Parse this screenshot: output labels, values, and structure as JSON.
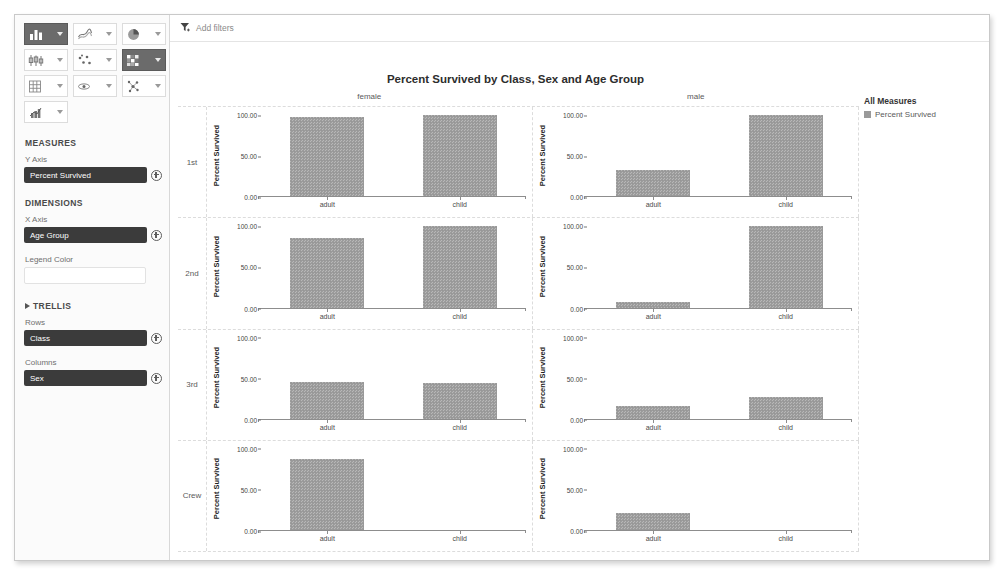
{
  "toolbar": {
    "buttons": [
      {
        "icon": "bar-chart-icon",
        "selected": true
      },
      {
        "icon": "line-chart-icon",
        "selected": false
      },
      {
        "icon": "pie-chart-icon",
        "selected": false
      },
      {
        "icon": "box-plot-icon",
        "selected": false
      },
      {
        "icon": "scatter-plot-icon",
        "selected": false
      },
      {
        "icon": "heatmap-icon",
        "selected": true
      },
      {
        "icon": "table-grid-icon",
        "selected": false
      },
      {
        "icon": "parallel-coords-icon",
        "selected": false
      },
      {
        "icon": "network-graph-icon",
        "selected": false
      },
      {
        "icon": "combo-chart-icon",
        "selected": false
      }
    ]
  },
  "sidebar": {
    "measures": {
      "heading": "MEASURES",
      "y_axis_label": "Y Axis",
      "y_axis_value": "Percent Survived"
    },
    "dimensions": {
      "heading": "DIMENSIONS",
      "x_axis_label": "X Axis",
      "x_axis_value": "Age Group",
      "legend_color_label": "Legend Color",
      "legend_color_value": ""
    },
    "trellis": {
      "heading": "TRELLIS",
      "rows_label": "Rows",
      "rows_value": "Class",
      "columns_label": "Columns",
      "columns_value": "Sex"
    }
  },
  "filter_bar": {
    "icon": "filter-icon",
    "label": "Add filters"
  },
  "legend": {
    "title": "All Measures",
    "entries": [
      {
        "label": "Percent Survived",
        "color": "#9a9a9a"
      }
    ]
  },
  "chart_data": {
    "type": "bar",
    "title": "Percent Survived by Class, Sex and Age Group",
    "xlabel": "",
    "ylabel": "Percent Survived",
    "ylim": [
      0,
      100
    ],
    "yticks": [
      "0.00",
      "50.00",
      "100.00"
    ],
    "ytick_values": [
      0,
      50,
      100
    ],
    "grid": false,
    "legend_position": "right",
    "trellis_rows_field": "Class",
    "trellis_columns_field": "Sex",
    "trellis_rows": [
      "1st",
      "2nd",
      "3rd",
      "Crew"
    ],
    "trellis_columns": [
      "female",
      "male"
    ],
    "categories": [
      "adult",
      "child"
    ],
    "panels": [
      {
        "row": "1st",
        "column": "female",
        "values": [
          97.2,
          100.0
        ]
      },
      {
        "row": "1st",
        "column": "male",
        "values": [
          32.6,
          100.0
        ]
      },
      {
        "row": "2nd",
        "column": "female",
        "values": [
          86.0,
          100.0
        ]
      },
      {
        "row": "2nd",
        "column": "male",
        "values": [
          8.3,
          100.0
        ]
      },
      {
        "row": "3rd",
        "column": "female",
        "values": [
          46.1,
          45.2
        ]
      },
      {
        "row": "3rd",
        "column": "male",
        "values": [
          16.2,
          27.1
        ]
      },
      {
        "row": "Crew",
        "column": "female",
        "values": [
          87.0,
          0
        ]
      },
      {
        "row": "Crew",
        "column": "male",
        "values": [
          22.3,
          0
        ]
      }
    ]
  }
}
